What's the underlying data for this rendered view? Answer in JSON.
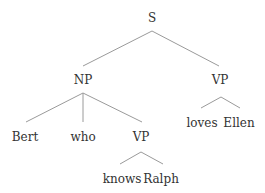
{
  "tree": {
    "type": "syntax-tree",
    "edge_color": "#9a9a9a",
    "text_color": "#333333",
    "nodes": [
      {
        "id": "S",
        "label": "S",
        "x": 152,
        "y": 18
      },
      {
        "id": "NP",
        "label": "NP",
        "x": 83,
        "y": 80
      },
      {
        "id": "VP1",
        "label": "VP",
        "x": 220,
        "y": 80
      },
      {
        "id": "Bert",
        "label": "Bert",
        "x": 25,
        "y": 137
      },
      {
        "id": "who",
        "label": "who",
        "x": 83,
        "y": 137
      },
      {
        "id": "VP2",
        "label": "VP",
        "x": 141,
        "y": 137
      },
      {
        "id": "loves",
        "label": "loves",
        "x": 202,
        "y": 123
      },
      {
        "id": "Ellen",
        "label": "Ellen",
        "x": 239,
        "y": 123
      },
      {
        "id": "knows",
        "label": "knows",
        "x": 122,
        "y": 179
      },
      {
        "id": "Ralph",
        "label": "Ralph",
        "x": 161,
        "y": 179
      }
    ],
    "edges": [
      {
        "from": "S",
        "to": "NP",
        "x1": 152,
        "y1": 31,
        "x2": 83,
        "y2": 66
      },
      {
        "from": "S",
        "to": "VP1",
        "x1": 152,
        "y1": 31,
        "x2": 219,
        "y2": 66
      },
      {
        "from": "NP",
        "to": "Bert",
        "x1": 83,
        "y1": 93,
        "x2": 26,
        "y2": 122
      },
      {
        "from": "NP",
        "to": "who",
        "x1": 83,
        "y1": 93,
        "x2": 83,
        "y2": 122
      },
      {
        "from": "NP",
        "to": "VP2",
        "x1": 83,
        "y1": 93,
        "x2": 142,
        "y2": 122
      },
      {
        "from": "VP1",
        "to": "loves",
        "x1": 221,
        "y1": 97,
        "x2": 201,
        "y2": 108
      },
      {
        "from": "VP1",
        "to": "Ellen",
        "x1": 221,
        "y1": 97,
        "x2": 240,
        "y2": 108
      },
      {
        "from": "VP2",
        "to": "knows",
        "x1": 141,
        "y1": 152,
        "x2": 120,
        "y2": 164
      },
      {
        "from": "VP2",
        "to": "Ralph",
        "x1": 141,
        "y1": 152,
        "x2": 163,
        "y2": 164
      }
    ]
  }
}
